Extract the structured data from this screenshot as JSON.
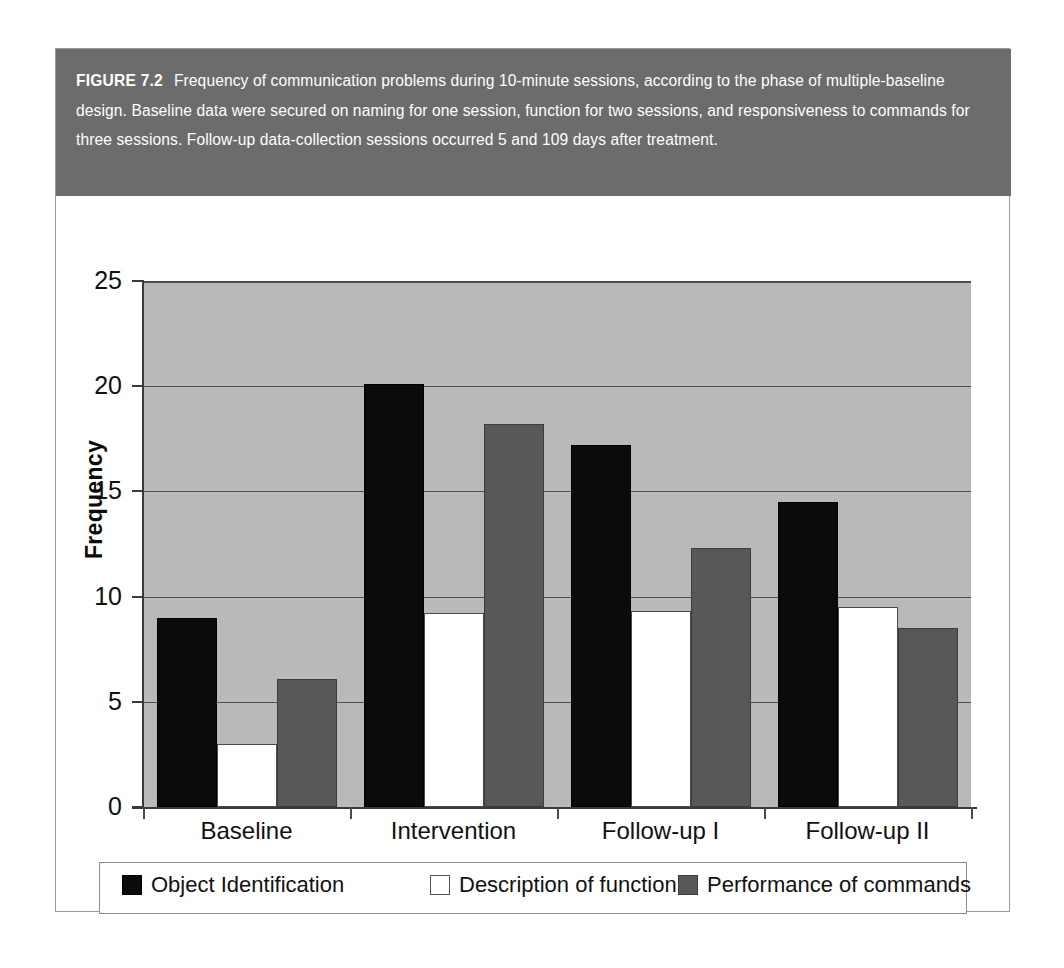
{
  "figure": {
    "number_label": "FIGURE 7.2",
    "caption": "Frequency of communication problems during 10-minute sessions, according to the phase of multiple-baseline design. Baseline data were secured on naming for one session, function for two sessions, and responsiveness to commands for three sessions. Follow-up data-collection sessions occurred 5 and 109 days after treatment.",
    "band_color": "#6c6c6c",
    "band_text_color": "#ffffff"
  },
  "chart_data": {
    "type": "bar",
    "title": "",
    "xlabel": "",
    "ylabel": "Frequency",
    "ylim": [
      0,
      25
    ],
    "yticks": [
      0,
      5,
      10,
      15,
      20,
      25
    ],
    "ytick_labels": [
      "0",
      "5",
      "10",
      "15",
      "20",
      "25"
    ],
    "grid": true,
    "grid_axis": "y",
    "legend_position": "bottom",
    "plot_background": "#b9b9b9",
    "categories": [
      "Baseline",
      "Intervention",
      "Follow-up I",
      "Follow-up II"
    ],
    "series": [
      {
        "name": "Object Identification",
        "color": "#0b0b0b",
        "values": [
          9.0,
          20.1,
          17.2,
          14.5
        ]
      },
      {
        "name": "Description of function",
        "color": "#ffffff",
        "values": [
          3.0,
          9.2,
          9.3,
          9.5
        ]
      },
      {
        "name": "Performance of commands",
        "color": "#58585a",
        "values": [
          6.1,
          18.2,
          12.3,
          8.5
        ]
      }
    ]
  }
}
